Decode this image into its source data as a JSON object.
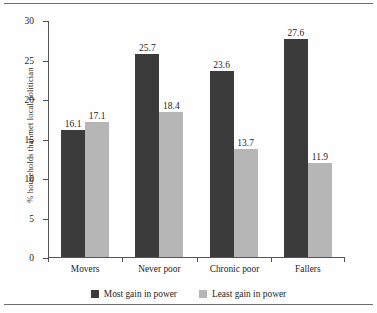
{
  "chart_data": {
    "type": "bar",
    "title": "",
    "xlabel": "",
    "ylabel": "% households that met local politician",
    "categories": [
      "Movers",
      "Never poor",
      "Chronic poor",
      "Fallers"
    ],
    "series": [
      {
        "name": "Most gain in power",
        "color": "#3b3b3b",
        "values": [
          16.1,
          25.7,
          23.6,
          27.6
        ]
      },
      {
        "name": "Least gain in power",
        "color": "#b6b6b6",
        "values": [
          17.1,
          18.4,
          13.7,
          11.9
        ]
      }
    ],
    "ylim": [
      0,
      30
    ],
    "yticks": [
      0,
      5,
      10,
      15,
      20,
      25,
      30
    ],
    "ytick_labels": [
      "0",
      "5",
      "10",
      "15",
      "20",
      "25",
      "30"
    ],
    "grid": false,
    "legend_position": "bottom",
    "data_labels": true
  },
  "labels": {
    "value_0_0": "16.1",
    "value_0_1": "17.1",
    "value_1_0": "25.7",
    "value_1_1": "18.4",
    "value_2_0": "23.6",
    "value_2_1": "13.7",
    "value_3_0": "27.6",
    "value_3_1": "11.9"
  }
}
